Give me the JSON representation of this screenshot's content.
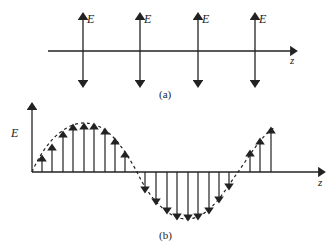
{
  "panel_a": {
    "caption": "(a)",
    "field_label": "E",
    "axis_label": "z",
    "arrow_positions_x": [
      83,
      140,
      198,
      255
    ]
  },
  "panel_b": {
    "caption": "(b)",
    "y_axis_label": "E",
    "axis_label": "z",
    "up_arrows_x": [
      42,
      52,
      63,
      73,
      84,
      94,
      105,
      115,
      125
    ],
    "down_arrows_x": [
      145,
      156,
      167,
      177,
      188,
      198,
      209,
      219,
      229
    ],
    "right_up_arrows_x": [
      250,
      260,
      271
    ]
  },
  "colors": {
    "ink": "#222222"
  }
}
